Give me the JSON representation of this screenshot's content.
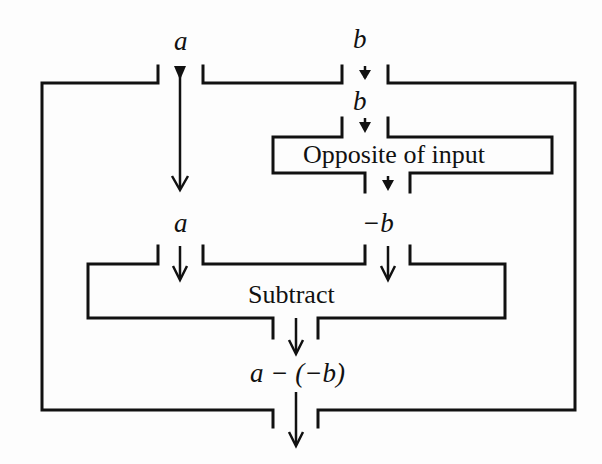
{
  "diagram": {
    "type": "function-machine",
    "inputs": {
      "a": "a",
      "b": "b"
    },
    "inner_labels": {
      "b_inside": "b",
      "a_inside": "a",
      "neg_b": "−b",
      "output": "a − (−b)"
    },
    "boxes": {
      "opposite": {
        "label": "Opposite of input"
      },
      "subtract": {
        "label": "Subtract"
      }
    },
    "colors": {
      "line": "#111111",
      "background": "#fdfdfd"
    }
  }
}
